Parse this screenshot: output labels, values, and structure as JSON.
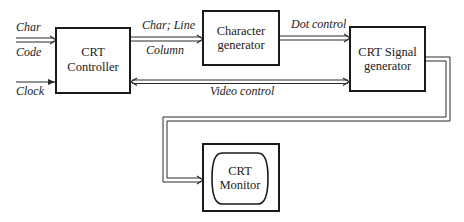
{
  "blocks": {
    "crt_controller": {
      "line1": "CRT",
      "line2": "Controller"
    },
    "char_generator": {
      "line1": "Character",
      "line2": "generator"
    },
    "signal_generator": {
      "line1": "CRT Signal",
      "line2": "generator"
    },
    "crt_monitor": {
      "line1": "CRT",
      "line2": "Monitor"
    }
  },
  "signals": {
    "char": "Char",
    "code": "Code",
    "clock": "Clock",
    "char_line": "Char; Line",
    "column": "Column",
    "dot_control": "Dot control",
    "video_control": "Video control"
  }
}
